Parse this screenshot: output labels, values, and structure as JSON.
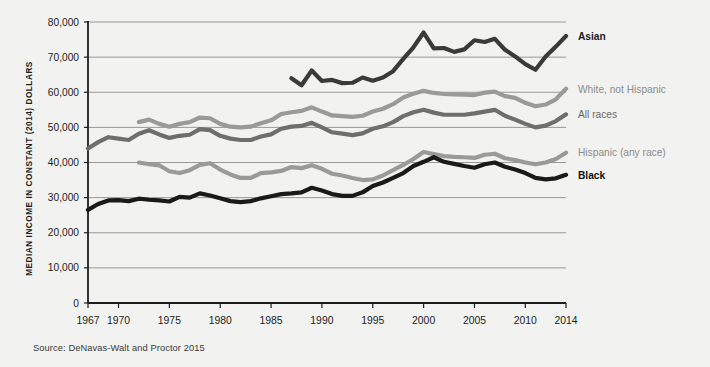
{
  "figure": {
    "y_axis_title": "MEDIAN INCOME IN CONSTANT (2014) DOLLARS",
    "source_note": "Source: DeNavas-Walt and Proctor 2015"
  },
  "chart_data": {
    "type": "line",
    "title": "",
    "subtitle": "",
    "xlabel": "",
    "ylabel": "MEDIAN INCOME IN CONSTANT (2014) DOLLARS",
    "xlim": [
      1967,
      2014
    ],
    "ylim": [
      0,
      80000
    ],
    "ytick_values": [
      0,
      10000,
      20000,
      30000,
      40000,
      50000,
      60000,
      70000,
      80000
    ],
    "ytick_labels": [
      "0",
      "10,000",
      "20,000",
      "30,000",
      "40,000",
      "50,000",
      "60,000",
      "70,000",
      "80,000"
    ],
    "xtick_values": [
      1967,
      1970,
      1975,
      1980,
      1985,
      1990,
      1995,
      2000,
      2005,
      2010,
      2014
    ],
    "xtick_labels": [
      "1967",
      "1970",
      "1975",
      "1980",
      "1985",
      "1990",
      "1995",
      "2000",
      "2005",
      "2010",
      "2014"
    ],
    "grid": "horizontal",
    "legend_position": "right-inline-labels",
    "series": [
      {
        "name": "Asian",
        "label": "Asian",
        "color": "#3a3a3a",
        "label_color": "#1c1c1c",
        "label_weight": "bold",
        "x": [
          1987,
          1988,
          1989,
          1990,
          1991,
          1992,
          1993,
          1994,
          1995,
          1996,
          1997,
          1998,
          1999,
          2000,
          2001,
          2002,
          2003,
          2004,
          2005,
          2006,
          2007,
          2008,
          2009,
          2010,
          2011,
          2012,
          2013,
          2014
        ],
        "y": [
          64000,
          62000,
          66200,
          63200,
          63500,
          62600,
          62700,
          64200,
          63300,
          64200,
          66000,
          69500,
          72800,
          77000,
          72500,
          72600,
          71500,
          72200,
          74800,
          74300,
          75200,
          72100,
          70200,
          68000,
          66400,
          70200,
          73000,
          76000
        ]
      },
      {
        "name": "White, not Hispanic",
        "label": "White, not Hispanic",
        "color": "#9a9a9a",
        "label_color": "#8c8c8c",
        "label_weight": "normal",
        "x": [
          1972,
          1973,
          1974,
          1975,
          1976,
          1977,
          1978,
          1979,
          1980,
          1981,
          1982,
          1983,
          1984,
          1985,
          1986,
          1987,
          1988,
          1989,
          1990,
          1991,
          1992,
          1993,
          1994,
          1995,
          1996,
          1997,
          1998,
          1999,
          2000,
          2001,
          2002,
          2003,
          2004,
          2005,
          2006,
          2007,
          2008,
          2009,
          2010,
          2011,
          2012,
          2013,
          2014
        ],
        "y": [
          51500,
          52200,
          51000,
          50200,
          51000,
          51500,
          52800,
          52600,
          51000,
          50200,
          50000,
          50200,
          51200,
          52000,
          53800,
          54300,
          54700,
          55700,
          54500,
          53400,
          53200,
          53000,
          53300,
          54500,
          55300,
          56600,
          58500,
          59600,
          60400,
          59800,
          59500,
          59400,
          59300,
          59200,
          59900,
          60200,
          58900,
          58400,
          57000,
          56000,
          56500,
          58000,
          61000
        ]
      },
      {
        "name": "All races",
        "label": "All races",
        "color": "#6e6e6e",
        "label_color": "#6a6a6a",
        "label_weight": "normal",
        "x": [
          1967,
          1968,
          1969,
          1970,
          1971,
          1972,
          1973,
          1974,
          1975,
          1976,
          1977,
          1978,
          1979,
          1980,
          1981,
          1982,
          1983,
          1984,
          1985,
          1986,
          1987,
          1988,
          1989,
          1990,
          1991,
          1992,
          1993,
          1994,
          1995,
          1996,
          1997,
          1998,
          1999,
          2000,
          2001,
          2002,
          2003,
          2004,
          2005,
          2006,
          2007,
          2008,
          2009,
          2010,
          2011,
          2012,
          2013,
          2014
        ],
        "y": [
          44000,
          45800,
          47200,
          46800,
          46400,
          48200,
          49200,
          48000,
          47000,
          47600,
          47900,
          49500,
          49200,
          47600,
          46800,
          46400,
          46400,
          47400,
          48000,
          49600,
          50200,
          50400,
          51300,
          50000,
          48600,
          48200,
          47800,
          48300,
          49600,
          50300,
          51500,
          53200,
          54300,
          55000,
          54200,
          53600,
          53600,
          53600,
          54000,
          54500,
          55000,
          53300,
          52200,
          51000,
          50000,
          50500,
          51800,
          53700
        ]
      },
      {
        "name": "Hispanic (any race)",
        "label": "Hispanic (any race)",
        "color": "#9a9a9a",
        "label_color": "#8c8c8c",
        "label_weight": "normal",
        "x": [
          1972,
          1973,
          1974,
          1975,
          1976,
          1977,
          1978,
          1979,
          1980,
          1981,
          1982,
          1983,
          1984,
          1985,
          1986,
          1987,
          1988,
          1989,
          1990,
          1991,
          1992,
          1993,
          1994,
          1995,
          1996,
          1997,
          1998,
          1999,
          2000,
          2001,
          2002,
          2003,
          2004,
          2005,
          2006,
          2007,
          2008,
          2009,
          2010,
          2011,
          2012,
          2013,
          2014
        ],
        "y": [
          40000,
          39500,
          39200,
          37500,
          37000,
          37800,
          39300,
          39800,
          38000,
          36600,
          35600,
          35600,
          37000,
          37200,
          37600,
          38700,
          38400,
          39200,
          38200,
          36800,
          36300,
          35600,
          35000,
          35200,
          36300,
          37800,
          39300,
          41000,
          43000,
          42400,
          41800,
          41600,
          41500,
          41300,
          42200,
          42500,
          41200,
          40700,
          40000,
          39500,
          40000,
          41000,
          42800
        ]
      },
      {
        "name": "Black",
        "label": "Black",
        "color": "#1a1a1a",
        "label_color": "#101010",
        "label_weight": "bold",
        "x": [
          1967,
          1968,
          1969,
          1970,
          1971,
          1972,
          1973,
          1974,
          1975,
          1976,
          1977,
          1978,
          1979,
          1980,
          1981,
          1982,
          1983,
          1984,
          1985,
          1986,
          1987,
          1988,
          1989,
          1990,
          1991,
          1992,
          1993,
          1994,
          1995,
          1996,
          1997,
          1998,
          1999,
          2000,
          2001,
          2002,
          2003,
          2004,
          2005,
          2006,
          2007,
          2008,
          2009,
          2010,
          2011,
          2012,
          2013,
          2014
        ],
        "y": [
          26500,
          28200,
          29200,
          29300,
          29000,
          29700,
          29400,
          29200,
          28900,
          30200,
          30000,
          31200,
          30600,
          29800,
          29000,
          28700,
          29000,
          29800,
          30400,
          31000,
          31200,
          31500,
          32800,
          32000,
          31000,
          30500,
          30500,
          31500,
          33300,
          34300,
          35600,
          37000,
          39000,
          40200,
          41500,
          40200,
          39600,
          39000,
          38500,
          39500,
          40000,
          38800,
          38000,
          37000,
          35600,
          35200,
          35500,
          36500
        ]
      }
    ]
  }
}
